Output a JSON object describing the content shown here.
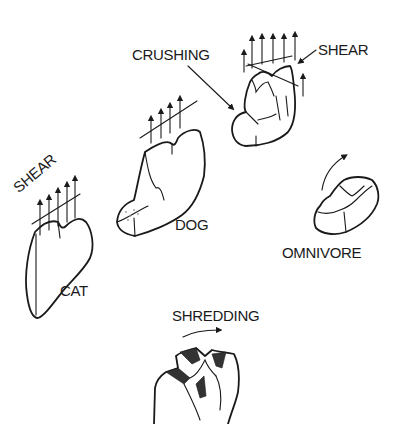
{
  "diagram": {
    "labels": {
      "crushing": "CRUSHING",
      "shear_top": "SHEAR",
      "shear_cat": "SHEAR",
      "dog": "DOG",
      "cat": "CAT",
      "omnivore": "OMNIVORE",
      "shredding": "SHREDDING"
    },
    "figures": [
      {
        "name": "cat-tooth",
        "label": "CAT",
        "annotation": "SHEAR"
      },
      {
        "name": "dog-tooth",
        "label": "DOG"
      },
      {
        "name": "crushing-shear-tooth",
        "annotations": [
          "CRUSHING",
          "SHEAR"
        ]
      },
      {
        "name": "omnivore-tooth",
        "label": "OMNIVORE"
      },
      {
        "name": "shredding-tooth",
        "annotation": "SHREDDING"
      }
    ],
    "colors": {
      "ink": "#1a1a1a",
      "background": "#ffffff"
    }
  }
}
